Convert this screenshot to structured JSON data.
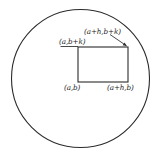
{
  "figure": {
    "background_color": "#ffffff",
    "stroke_color": "#2b2b2b",
    "text_color": "#1a1a1a",
    "circle": {
      "name": "region-boundary-circle",
      "center_x": 80.5,
      "center_y": 78.5,
      "radius": 69,
      "stroke_width": 1.1,
      "fill": "none"
    },
    "rectangle": {
      "name": "inscribed-rectangle",
      "x": 78,
      "y": 47,
      "width": 50,
      "height": 35,
      "stroke_width": 1.1,
      "fill": "none"
    },
    "leaders": [
      {
        "name": "leader-top-left",
        "type": "line",
        "x1": 60.5,
        "y1": 46.5,
        "x2": 78,
        "y2": 46.5
      },
      {
        "name": "leader-top-right",
        "type": "arrow",
        "x1": 110,
        "y1": 34.5,
        "x2": 127.5,
        "y2": 46.5
      }
    ],
    "labels": {
      "top_right": "(a+h,b+k)",
      "top_left": "(a,b+k)",
      "bottom_left": "(a,b)",
      "bottom_right": "(a+h,b)"
    }
  }
}
